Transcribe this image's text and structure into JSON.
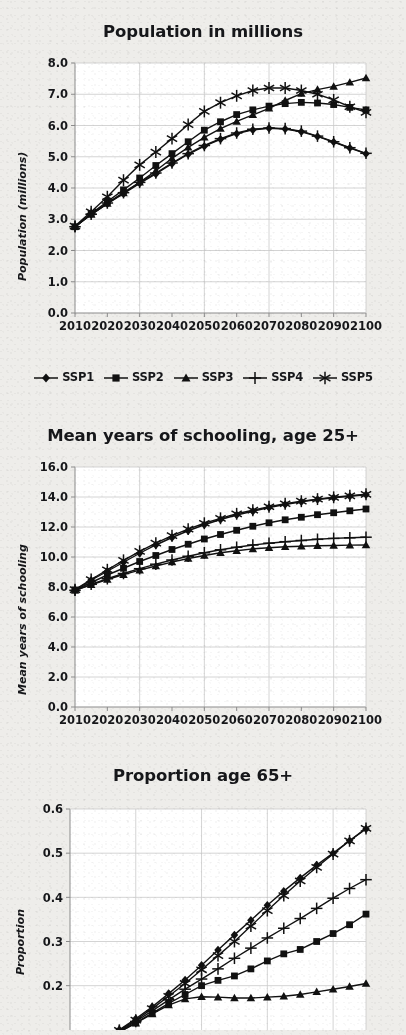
{
  "figure": {
    "background_color": "#eeedea",
    "plot_background_color": "#ffffff",
    "series_color": "#111111",
    "grid_color": "#c9c9c9",
    "axis_color": "#8b8b8b"
  },
  "legend": {
    "position": "below-first-chart",
    "entries": [
      {
        "label": "SSP1",
        "marker": "diamond"
      },
      {
        "label": "SSP2",
        "marker": "square"
      },
      {
        "label": "SSP3",
        "marker": "triangle"
      },
      {
        "label": "SSP4",
        "marker": "plus"
      },
      {
        "label": "SSP5",
        "marker": "asterisk"
      }
    ]
  },
  "chart_data": [
    {
      "type": "line",
      "title": "Population in millions",
      "xlabel": "",
      "ylabel": "Population (millions)",
      "x": [
        2010,
        2015,
        2020,
        2025,
        2030,
        2035,
        2040,
        2045,
        2050,
        2055,
        2060,
        2065,
        2070,
        2075,
        2080,
        2085,
        2090,
        2095,
        2100
      ],
      "xlim": [
        2010,
        2100
      ],
      "ylim": [
        0.0,
        8.0
      ],
      "ytick_labels": [
        "0.0",
        "1.0",
        "2.0",
        "3.0",
        "4.0",
        "5.0",
        "6.0",
        "7.0",
        "8.0"
      ],
      "ytick_values": [
        0.0,
        1.0,
        2.0,
        3.0,
        4.0,
        5.0,
        6.0,
        7.0,
        8.0
      ],
      "xtick_labels": [
        "2010",
        "2020",
        "2030",
        "2040",
        "2050",
        "2060",
        "2070",
        "2080",
        "2090",
        "2100"
      ],
      "xtick_values": [
        2010,
        2020,
        2030,
        2040,
        2050,
        2060,
        2070,
        2080,
        2090,
        2100
      ],
      "gridline_x_values": [
        2030,
        2050,
        2070,
        2090
      ],
      "grid": true,
      "series": [
        {
          "name": "SSP1",
          "marker": "diamond",
          "values": [
            2.76,
            3.15,
            3.5,
            3.82,
            4.15,
            4.45,
            4.78,
            5.08,
            5.34,
            5.56,
            5.74,
            5.86,
            5.91,
            5.89,
            5.8,
            5.65,
            5.47,
            5.28,
            5.1
          ]
        },
        {
          "name": "SSP2",
          "marker": "square",
          "values": [
            2.76,
            3.18,
            3.57,
            3.94,
            4.32,
            4.72,
            5.1,
            5.48,
            5.85,
            6.12,
            6.35,
            6.5,
            6.62,
            6.7,
            6.74,
            6.72,
            6.67,
            6.58,
            6.5
          ]
        },
        {
          "name": "SSP3",
          "marker": "triangle",
          "values": [
            2.76,
            3.15,
            3.5,
            3.84,
            4.18,
            4.55,
            4.95,
            5.3,
            5.62,
            5.9,
            6.13,
            6.34,
            6.55,
            6.8,
            7.02,
            7.15,
            7.25,
            7.38,
            7.52
          ]
        },
        {
          "name": "SSP4",
          "marker": "plus",
          "values": [
            2.76,
            3.16,
            3.52,
            3.85,
            4.18,
            4.48,
            4.8,
            5.1,
            5.36,
            5.58,
            5.76,
            5.88,
            5.92,
            5.9,
            5.82,
            5.66,
            5.48,
            5.29,
            5.11
          ]
        },
        {
          "name": "SSP5",
          "marker": "asterisk",
          "values": [
            2.78,
            3.24,
            3.72,
            4.25,
            4.74,
            5.15,
            5.58,
            6.03,
            6.45,
            6.73,
            6.95,
            7.12,
            7.2,
            7.2,
            7.12,
            7.0,
            6.82,
            6.6,
            6.42
          ]
        }
      ]
    },
    {
      "type": "line",
      "title": "Mean years of schooling, age 25+",
      "xlabel": "",
      "ylabel": "Mean years of schooling",
      "x": [
        2010,
        2015,
        2020,
        2025,
        2030,
        2035,
        2040,
        2045,
        2050,
        2055,
        2060,
        2065,
        2070,
        2075,
        2080,
        2085,
        2090,
        2095,
        2100
      ],
      "xlim": [
        2010,
        2100
      ],
      "ylim": [
        0.0,
        16.0
      ],
      "ytick_labels": [
        "0.0",
        "2.0",
        "4.0",
        "6.0",
        "8.0",
        "10.0",
        "12.0",
        "14.0",
        "16.0"
      ],
      "ytick_values": [
        0.0,
        2.0,
        4.0,
        6.0,
        8.0,
        10.0,
        12.0,
        14.0,
        16.0
      ],
      "xtick_labels": [
        "2010",
        "2020",
        "2030",
        "2040",
        "2050",
        "2060",
        "2070",
        "2080",
        "2090",
        "2100"
      ],
      "xtick_values": [
        2010,
        2020,
        2030,
        2040,
        2050,
        2060,
        2070,
        2080,
        2090,
        2100
      ],
      "gridline_x_values": [
        2030,
        2050,
        2070,
        2090
      ],
      "grid": true,
      "series": [
        {
          "name": "SSP1",
          "marker": "diamond",
          "values": [
            7.8,
            8.45,
            9.05,
            9.65,
            10.25,
            10.8,
            11.3,
            11.75,
            12.15,
            12.5,
            12.8,
            13.05,
            13.3,
            13.5,
            13.68,
            13.83,
            13.95,
            14.05,
            14.15
          ]
        },
        {
          "name": "SSP2",
          "marker": "square",
          "values": [
            7.8,
            8.3,
            8.8,
            9.25,
            9.7,
            10.1,
            10.5,
            10.85,
            11.2,
            11.5,
            11.78,
            12.05,
            12.28,
            12.48,
            12.65,
            12.82,
            12.95,
            13.08,
            13.2
          ]
        },
        {
          "name": "SSP3",
          "marker": "triangle",
          "values": [
            7.78,
            8.15,
            8.5,
            8.82,
            9.12,
            9.4,
            9.66,
            9.9,
            10.1,
            10.28,
            10.42,
            10.54,
            10.62,
            10.68,
            10.72,
            10.75,
            10.77,
            10.79,
            10.8
          ]
        },
        {
          "name": "SSP4",
          "marker": "plus",
          "values": [
            7.78,
            8.18,
            8.55,
            8.9,
            9.22,
            9.52,
            9.8,
            10.05,
            10.28,
            10.48,
            10.65,
            10.8,
            10.92,
            11.02,
            11.1,
            11.18,
            11.24,
            11.28,
            11.32
          ]
        },
        {
          "name": "SSP5",
          "marker": "asterisk",
          "values": [
            7.82,
            8.5,
            9.15,
            9.78,
            10.38,
            10.92,
            11.42,
            11.86,
            12.25,
            12.58,
            12.88,
            13.12,
            13.35,
            13.55,
            13.72,
            13.86,
            13.98,
            14.08,
            14.18
          ]
        }
      ]
    },
    {
      "type": "line",
      "title": "Proportion age 65+",
      "xlabel": "",
      "ylabel": "Proportion",
      "x": [
        2010,
        2015,
        2020,
        2025,
        2030,
        2035,
        2040,
        2045,
        2050,
        2055,
        2060,
        2065,
        2070,
        2075,
        2080,
        2085,
        2090,
        2095,
        2100
      ],
      "xlim": [
        2010,
        2100
      ],
      "ylim": [
        0.0,
        0.6
      ],
      "ytick_labels": [
        "0.2",
        "0.3",
        "0.4",
        "0.5",
        "0.6"
      ],
      "ytick_values": [
        0.2,
        0.3,
        0.4,
        0.5,
        0.6
      ],
      "xtick_labels": [],
      "xtick_values": [],
      "gridline_x_values": [
        2030,
        2050,
        2070,
        2090
      ],
      "grid": true,
      "cropped_bottom": true,
      "series": [
        {
          "name": "SSP1",
          "marker": "diamond",
          "values": [
            0.055,
            0.065,
            0.08,
            0.1,
            0.125,
            0.152,
            0.182,
            0.213,
            0.246,
            0.281,
            0.315,
            0.348,
            0.382,
            0.414,
            0.444,
            0.473,
            0.5,
            0.528,
            0.555
          ]
        },
        {
          "name": "SSP2",
          "marker": "square",
          "values": [
            0.055,
            0.064,
            0.078,
            0.095,
            0.116,
            0.138,
            0.16,
            0.18,
            0.2,
            0.212,
            0.222,
            0.238,
            0.256,
            0.272,
            0.282,
            0.3,
            0.318,
            0.338,
            0.362
          ]
        },
        {
          "name": "SSP3",
          "marker": "triangle",
          "values": [
            0.055,
            0.064,
            0.078,
            0.095,
            0.115,
            0.136,
            0.156,
            0.17,
            0.175,
            0.174,
            0.172,
            0.172,
            0.174,
            0.176,
            0.18,
            0.186,
            0.192,
            0.198,
            0.205
          ]
        },
        {
          "name": "SSP4",
          "marker": "plus",
          "values": [
            0.055,
            0.064,
            0.079,
            0.097,
            0.119,
            0.143,
            0.168,
            0.192,
            0.215,
            0.238,
            0.262,
            0.285,
            0.308,
            0.33,
            0.352,
            0.375,
            0.398,
            0.42,
            0.44
          ]
        },
        {
          "name": "SSP5",
          "marker": "asterisk",
          "values": [
            0.055,
            0.065,
            0.08,
            0.099,
            0.122,
            0.148,
            0.176,
            0.205,
            0.236,
            0.268,
            0.3,
            0.335,
            0.37,
            0.404,
            0.437,
            0.468,
            0.498,
            0.528,
            0.556
          ]
        }
      ]
    }
  ]
}
